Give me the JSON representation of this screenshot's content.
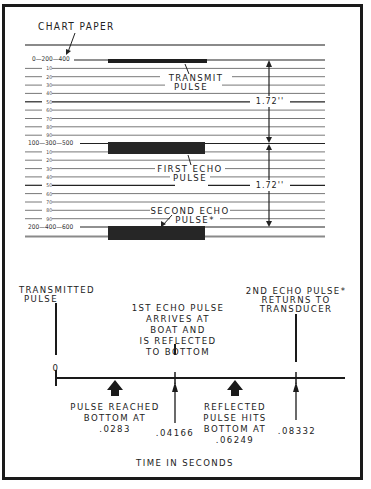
{
  "chart_paper": {
    "title": "CHART PAPER",
    "major_rows": [
      {
        "label": "0—200—400",
        "y": 60
      },
      {
        "label": "100—300—500",
        "y": 143
      },
      {
        "label": "200—400—600",
        "y": 227
      }
    ],
    "minor_ticks": [
      "10",
      "20",
      "30",
      "40",
      "50",
      "60",
      "70",
      "80",
      "90"
    ],
    "pulses": {
      "transmit": "TRANSMIT\nPULSE",
      "transmit_line1": "TRANSMIT",
      "transmit_line2": "PULSE",
      "first_echo_line1": "FIRST ECHO",
      "first_echo_line2": "PULSE",
      "second_echo_line1": "SECOND ECHO",
      "second_echo_line2": "PULSE*"
    },
    "dimensions": {
      "upper": "1.72''",
      "lower": "1.72''"
    }
  },
  "timeline": {
    "axis_label": "TIME IN SECONDS",
    "top_events": {
      "transmitted_line1": "TRANSMITTED",
      "transmitted_line2": "PULSE",
      "first_echo_line1": "1ST ECHO PULSE",
      "first_echo_line2": "ARRIVES AT",
      "first_echo_line3": "BOAT AND",
      "first_echo_line4": "IS REFLECTED",
      "first_echo_line5": "TO BOTTOM",
      "second_echo_line1": "2ND ECHO PULSE*",
      "second_echo_line2": "RETURNS TO",
      "second_echo_line3": "TRANSDUCER"
    },
    "zero_label": "0",
    "bottom_events": {
      "pulse_reached_line1": "PULSE REACHED",
      "pulse_reached_line2": "BOTTOM AT",
      "pulse_reached_line3": ".0283",
      "first_echo_time": ".04166",
      "reflected_line1": "REFLECTED",
      "reflected_line2": "PULSE HITS",
      "reflected_line3": "BOTTOM AT",
      "reflected_line4": ".06249",
      "second_echo_time": ".08332"
    },
    "times": [
      0,
      0.0283,
      0.04166,
      0.06249,
      0.08332
    ]
  }
}
